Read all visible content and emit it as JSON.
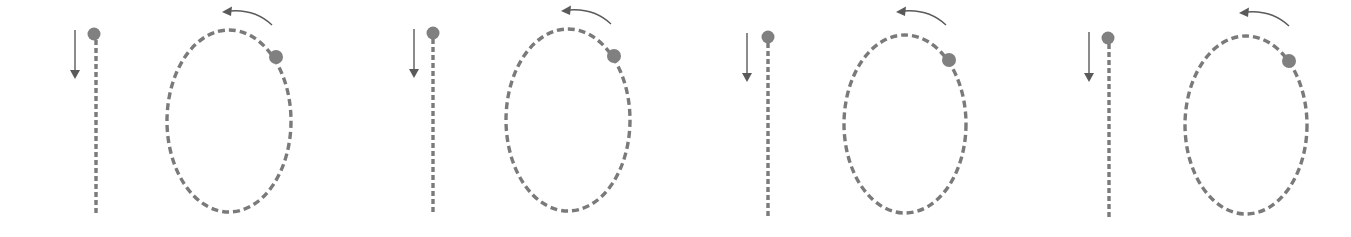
{
  "worksheet": {
    "content": "Number 10 tracing guide",
    "stroke_color": "#7a7a7a",
    "arrow_color": "#5a5a5a",
    "dot_color": "#808080",
    "figures": [
      {
        "label": "10",
        "digit_one": "1",
        "digit_zero": "0",
        "offset_x": 0,
        "offset_y": 0
      },
      {
        "label": "10",
        "digit_one": "1",
        "digit_zero": "0",
        "offset_x": 339,
        "offset_y": -1
      },
      {
        "label": "10",
        "digit_one": "1",
        "digit_zero": "0",
        "offset_x": 674,
        "offset_y": 3
      },
      {
        "label": "10",
        "digit_one": "1",
        "digit_zero": "0",
        "offset_x": 1014,
        "offset_y": 4
      }
    ]
  }
}
